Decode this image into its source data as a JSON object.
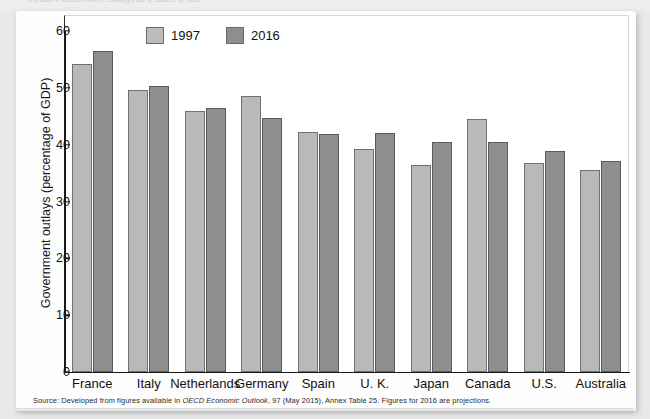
{
  "figure": {
    "top_caption_ghost": "Exhibit 4  Government Outlays as a Share of GDP",
    "source_prefix": "Source: Developed from figures available in ",
    "source_italic": "OECD Economic Outlook",
    "source_suffix": ", 97 (May 2015), Annex Table 25. Figures for 2016 are projections."
  },
  "colors": {
    "series_1997": "#b9b9b9",
    "series_2016": "#8e8e8e",
    "axis": "#1a1a1a",
    "page_background": "#e9e9e9",
    "panel_background": "#fdfdfd"
  },
  "chart_data": {
    "type": "bar",
    "title": "",
    "xlabel": "",
    "ylabel": "Government outlays (percentage of GDP)",
    "ylim": [
      0,
      60
    ],
    "yticks": [
      0,
      10,
      20,
      30,
      40,
      50,
      60
    ],
    "ytick_labels": [
      "0",
      "10",
      "20",
      "30",
      "40",
      "50",
      "60"
    ],
    "grid": false,
    "legend_position": "top-left-inside",
    "categories": [
      "France",
      "Italy",
      "Netherlands",
      "Germany",
      "Spain",
      "U. K.",
      "Japan",
      "Canada",
      "U.S.",
      "Australia"
    ],
    "series": [
      {
        "name": "1997",
        "color": "#b9b9b9",
        "values": [
          54.2,
          49.7,
          46.0,
          48.6,
          42.2,
          39.3,
          36.4,
          44.6,
          36.8,
          35.6
        ]
      },
      {
        "name": "2016",
        "color": "#8e8e8e",
        "values": [
          56.5,
          50.4,
          46.4,
          44.7,
          41.9,
          42.1,
          40.4,
          40.4,
          38.9,
          37.2
        ]
      }
    ]
  }
}
